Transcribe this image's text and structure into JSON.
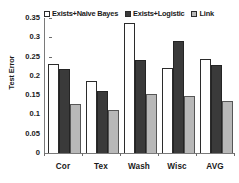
{
  "chart_data": {
    "type": "bar",
    "title": "",
    "xlabel": "",
    "ylabel": "Test Error",
    "ylim": [
      0,
      0.35
    ],
    "ytick_labels": [
      "0.35",
      "0.3",
      "0.25",
      "0.2",
      "0.15",
      "0.1",
      "0.05",
      "0"
    ],
    "ytick_values": [
      0.35,
      0.3,
      0.25,
      0.2,
      0.15,
      0.1,
      0.05,
      0
    ],
    "grid": false,
    "legend_position": "top",
    "categories": [
      "Cor",
      "Tex",
      "Wash",
      "Wisc",
      "AVG"
    ],
    "series": [
      {
        "name": "Exists+Naive Bayes",
        "color": "#ffffff",
        "swatch": "sw-white",
        "values": [
          0.232,
          0.188,
          0.338,
          0.221,
          0.245
        ]
      },
      {
        "name": "Exists+Logistic",
        "color": "#3a3a3a",
        "swatch": "sw-dark",
        "values": [
          0.217,
          0.162,
          0.242,
          0.291,
          0.227
        ]
      },
      {
        "name": "Link",
        "color": "#b8b8b8",
        "swatch": "sw-gray",
        "values": [
          0.128,
          0.112,
          0.154,
          0.148,
          0.136
        ]
      }
    ]
  }
}
